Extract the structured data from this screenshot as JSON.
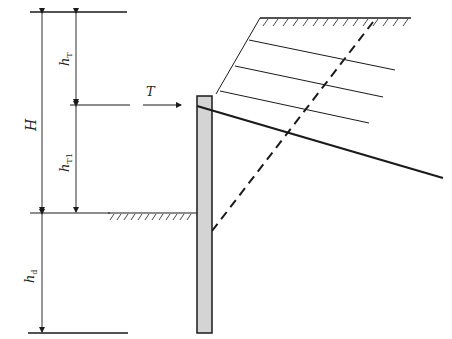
{
  "diagram": {
    "title": "",
    "type": "anchored retaining wall (single anchor) earth pressure diagram",
    "labels": {
      "H": "H",
      "hT": "h",
      "hT_sub": "T",
      "hT1": "h",
      "hT1_sub": "T1",
      "hd": "h",
      "hd_sub": "d",
      "T": "T"
    },
    "colors": {
      "line": "#1a1a1a",
      "wall_fill": "#d4d4d4",
      "background": "#ffffff"
    },
    "elements": [
      "top reference line",
      "dimension H (total excavation height)",
      "dimension hT (anchor depth from top)",
      "dimension hT1 (anchor to excavation bottom)",
      "dimension hd (embedment depth)",
      "anchor force arrow T",
      "retaining wall",
      "excavation ground surface with hatching",
      "sloped backfill with hatched top surface",
      "inclined anchor line",
      "dashed failure plane",
      "three parallel soil-layer lines"
    ]
  }
}
